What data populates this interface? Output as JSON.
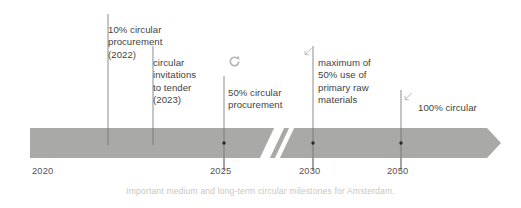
{
  "figure": {
    "caption": "Important medium and long-term circular milestones for Amsterdam.",
    "bar_color": "#a9a9a8",
    "text_color": "#3f3f3f",
    "year_label_color": "#54534f",
    "caption_color": "#c9c7c4",
    "leader_line_color": "#6f6f6f",
    "dot_color": "#2b2b2b",
    "break_marker_color": "#ffffff"
  },
  "axis": {
    "label": "",
    "ticks": [
      {
        "year": "2020",
        "x": 32,
        "has_dot": false,
        "has_tick_line": false
      },
      {
        "year": "2025",
        "x": 224,
        "has_dot": true,
        "has_tick_line": true
      },
      {
        "year": "2030",
        "x": 313,
        "has_dot": true,
        "has_tick_line": true
      },
      {
        "year": "2050",
        "x": 401,
        "has_dot": true,
        "has_tick_line": true
      }
    ],
    "break_marker": {
      "x": 272,
      "label": "axis-break"
    }
  },
  "milestones": [
    {
      "id": "milestone-2022",
      "text": "10% circular\nprocurement\n(2022)",
      "icon": "none",
      "leader_line": {
        "x": 108,
        "y_top": 14,
        "y_bottom": 145
      },
      "text_x": 108,
      "text_y": 11
    },
    {
      "id": "milestone-2023",
      "text": "circular\ninvitations\nto tender\n(2023)",
      "icon": "none",
      "leader_line": {
        "x": 153,
        "y_top": 46,
        "y_bottom": 145
      },
      "text_x": 153,
      "text_y": 44
    },
    {
      "id": "milestone-2025",
      "text": "50% circular\nprocurement",
      "icon": "circular-arrow",
      "leader_line": {
        "x": 224,
        "y_top": 76,
        "y_bottom": 170
      },
      "text_x": 228,
      "text_y": 74,
      "icon_x": 228,
      "icon_y": 55
    },
    {
      "id": "milestone-2030",
      "text": "maximum of\n50% use of\nprimary raw\nmaterials",
      "icon": "arrow-down-left",
      "leader_line": {
        "x": 313,
        "y_top": 46,
        "y_bottom": 170
      },
      "text_x": 318,
      "text_y": 44,
      "icon_x": 305,
      "icon_y": 46
    },
    {
      "id": "milestone-2050",
      "text": "100% circular",
      "icon": "arrow-down-left",
      "leader_line": {
        "x": 401,
        "y_top": 90,
        "y_bottom": 170
      },
      "text_x": 418,
      "text_y": 89,
      "icon_x": 405,
      "icon_y": 91
    }
  ]
}
